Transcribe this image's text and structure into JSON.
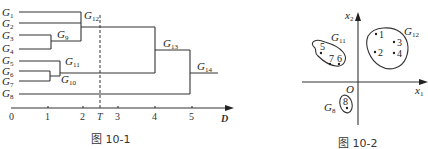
{
  "figure1": {
    "caption": "图 10-1",
    "leaves": [
      "G1",
      "G2",
      "G3",
      "G4",
      "G5",
      "G6",
      "G7",
      "G8"
    ],
    "leaf_labels": [
      {
        "base": "G",
        "sub": "1"
      },
      {
        "base": "G",
        "sub": "2"
      },
      {
        "base": "G",
        "sub": "3"
      },
      {
        "base": "G",
        "sub": "4"
      },
      {
        "base": "G",
        "sub": "5"
      },
      {
        "base": "G",
        "sub": "6"
      },
      {
        "base": "G",
        "sub": "7"
      },
      {
        "base": "G",
        "sub": "8"
      }
    ],
    "merges": [
      {
        "name": "G9",
        "base": "G",
        "sub": "9",
        "children": [
          "G3",
          "G4"
        ],
        "distance": 1.1
      },
      {
        "name": "G10",
        "base": "G",
        "sub": "10",
        "children": [
          "G6",
          "G7"
        ],
        "distance": 1.05
      },
      {
        "name": "G11",
        "base": "G",
        "sub": "11",
        "children": [
          "G5",
          "G10"
        ],
        "distance": 1.35
      },
      {
        "name": "G12",
        "base": "G",
        "sub": "12",
        "children": [
          "G1",
          "G2",
          "G9"
        ],
        "distance": 1.9
      },
      {
        "name": "G13",
        "base": "G",
        "sub": "13",
        "children": [
          "G12",
          "G11"
        ],
        "distance": 4
      },
      {
        "name": "G14",
        "base": "G",
        "sub": "14",
        "children": [
          "G13",
          "G8"
        ],
        "distance": 5
      }
    ],
    "axis": {
      "ticks": [
        "0",
        "1",
        "2",
        "T",
        "3",
        "4",
        "5"
      ],
      "label": "D",
      "threshold_label": "T"
    }
  },
  "figure2": {
    "caption": "图 10-2",
    "axes": {
      "x_label": "x",
      "x_sub": "1",
      "y_label": "x",
      "y_sub": "2",
      "origin": "O"
    },
    "clusters": [
      {
        "name": "G11",
        "base": "G",
        "sub": "11",
        "points": [
          "5",
          "7",
          "6"
        ]
      },
      {
        "name": "G12",
        "base": "G",
        "sub": "12",
        "points": [
          "1",
          "3",
          "2",
          "4"
        ]
      },
      {
        "name": "G8",
        "base": "G",
        "sub": "8",
        "points": [
          "8"
        ]
      }
    ]
  }
}
